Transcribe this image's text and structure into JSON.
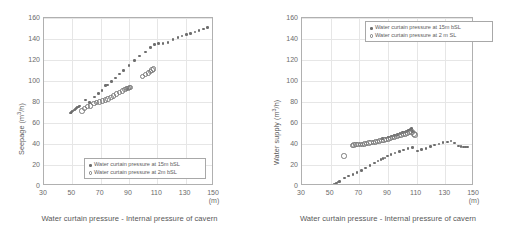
{
  "chart_data": [
    {
      "id": "left",
      "type": "scatter",
      "title": "",
      "xlabel": "Water curtain pressure - Internal pressure of cavern",
      "xunit": "(m)",
      "ylabel": "Seepage (m³/h)",
      "ylabel_main": "Seepage (m",
      "ylabel_exp": "3",
      "ylabel_tail": "/h)",
      "xlim": [
        30,
        150
      ],
      "ylim": [
        0,
        160
      ],
      "xticks": [
        30,
        50,
        70,
        90,
        110,
        130,
        150
      ],
      "yticks": [
        0,
        20,
        40,
        60,
        80,
        100,
        120,
        140,
        160
      ],
      "grid": true,
      "legend_position": "inside-bottom-right",
      "series": [
        {
          "name": "Water curtain pressure at 15m bSL",
          "marker": "filled-circle",
          "color": "#6d6d6d",
          "points": [
            [
              48.5,
              69.5
            ],
            [
              49.2,
              70.2
            ],
            [
              49.9,
              70.8
            ],
            [
              50.6,
              71.6
            ],
            [
              51.3,
              72.3
            ],
            [
              52.0,
              73.0
            ],
            [
              52.7,
              73.8
            ],
            [
              53.4,
              74.5
            ],
            [
              54.2,
              75.4
            ],
            [
              55.0,
              76.3
            ],
            [
              59.5,
              81.8
            ],
            [
              62.0,
              79.5
            ],
            [
              65.5,
              84.6
            ],
            [
              68.5,
              88.2
            ],
            [
              71.0,
              91.0
            ],
            [
              73.5,
              95.8
            ],
            [
              75.0,
              96.0
            ],
            [
              77.5,
              99.5
            ],
            [
              80.5,
              103.0
            ],
            [
              83.5,
              106.5
            ],
            [
              86.0,
              110.0
            ],
            [
              88.8,
              92.5
            ],
            [
              90.0,
              114.8
            ],
            [
              94.0,
              119.5
            ],
            [
              97.5,
              123.7
            ],
            [
              101.5,
              127.8
            ],
            [
              105.0,
              131.8
            ],
            [
              108.0,
              134.5
            ],
            [
              111.0,
              135.5
            ],
            [
              114.0,
              135.8
            ],
            [
              117.5,
              136.8
            ],
            [
              121.0,
              139.5
            ],
            [
              124.5,
              141.6
            ],
            [
              127.5,
              143.0
            ],
            [
              130.5,
              144.2
            ],
            [
              133.5,
              145.4
            ],
            [
              136.5,
              146.6
            ],
            [
              139.5,
              148.0
            ],
            [
              142.5,
              149.5
            ],
            [
              145.5,
              150.8
            ]
          ]
        },
        {
          "name": "Water curtain pressure at 2m bSL",
          "marker": "open-circle",
          "color": "#7a7a7a",
          "points": [
            [
              56.0,
              72.5
            ],
            [
              58.0,
              74.8
            ],
            [
              60.0,
              76.5
            ],
            [
              62.0,
              77.0
            ],
            [
              64.5,
              79.5
            ],
            [
              66.5,
              80.3
            ],
            [
              68.5,
              81.0
            ],
            [
              70.5,
              81.8
            ],
            [
              72.5,
              82.8
            ],
            [
              74.5,
              83.8
            ],
            [
              76.5,
              85.2
            ],
            [
              78.5,
              86.8
            ],
            [
              80.5,
              88.5
            ],
            [
              82.5,
              90.0
            ],
            [
              84.5,
              91.6
            ],
            [
              86.5,
              93.0
            ],
            [
              87.5,
              93.6
            ],
            [
              88.5,
              94.0
            ],
            [
              89.5,
              94.6
            ],
            [
              90.5,
              95.0
            ],
            [
              99.0,
              105.5
            ],
            [
              101.0,
              107.0
            ],
            [
              103.0,
              108.5
            ],
            [
              104.5,
              110.2
            ],
            [
              105.5,
              111.5
            ],
            [
              106.5,
              112.5
            ]
          ]
        }
      ],
      "legend": [
        {
          "label": "Water curtain pressure at 15m bSL",
          "marker": "filled-circle"
        },
        {
          "label": "Water curtain pressure at 2m bSL",
          "marker": "open-circle"
        }
      ]
    },
    {
      "id": "right",
      "type": "scatter",
      "title": "",
      "xlabel": "Water curtain pressure - Internal pressure of cavern",
      "xunit": "(m)",
      "ylabel": "Water supply (m³/h)",
      "ylabel_main": "Water supply (m",
      "ylabel_exp": "3",
      "ylabel_tail": "/h)",
      "xlim": [
        30,
        150
      ],
      "ylim": [
        0,
        160
      ],
      "xticks": [
        30,
        50,
        70,
        90,
        110,
        130,
        150
      ],
      "yticks": [
        0,
        20,
        40,
        60,
        80,
        100,
        120,
        140,
        160
      ],
      "grid": true,
      "legend_position": "inside-top-right",
      "series": [
        {
          "name": "Water curtain pressure at 15m bSL",
          "marker": "filled-circle",
          "color": "#6d6d6d",
          "points": [
            [
              48.5,
              0.3
            ],
            [
              49.3,
              0.4
            ],
            [
              50.0,
              0.5
            ],
            [
              50.8,
              0.7
            ],
            [
              51.5,
              1.0
            ],
            [
              52.2,
              1.3
            ],
            [
              53.0,
              1.8
            ],
            [
              53.8,
              2.3
            ],
            [
              54.5,
              3.0
            ],
            [
              55.2,
              3.7
            ],
            [
              56.0,
              4.4
            ],
            [
              59.5,
              7.5
            ],
            [
              62.5,
              9.5
            ],
            [
              65.5,
              11.0
            ],
            [
              68.5,
              13.0
            ],
            [
              71.5,
              15.0
            ],
            [
              74.5,
              17.0
            ],
            [
              77.5,
              19.5
            ],
            [
              80.5,
              22.0
            ],
            [
              83.0,
              24.0
            ],
            [
              85.0,
              25.5
            ],
            [
              86.5,
              26.0
            ],
            [
              88.0,
              26.5
            ],
            [
              89.5,
              28.5
            ],
            [
              92.0,
              30.0
            ],
            [
              95.0,
              31.5
            ],
            [
              98.0,
              33.0
            ],
            [
              101.0,
              34.3
            ],
            [
              104.0,
              35.5
            ],
            [
              107.0,
              36.5
            ],
            [
              86.0,
              45.0
            ],
            [
              88.5,
              45.8
            ],
            [
              90.5,
              46.5
            ],
            [
              92.5,
              47.5
            ],
            [
              94.5,
              48.3
            ],
            [
              96.5,
              49.2
            ],
            [
              98.5,
              50.0
            ],
            [
              100.0,
              50.8
            ],
            [
              101.5,
              51.5
            ],
            [
              102.5,
              52.0
            ],
            [
              103.5,
              52.5
            ],
            [
              104.5,
              53.2
            ],
            [
              105.5,
              54.0
            ],
            [
              106.5,
              54.8
            ],
            [
              107.0,
              52.0
            ],
            [
              110.5,
              33.5
            ],
            [
              113.5,
              34.5
            ],
            [
              116.5,
              35.5
            ],
            [
              119.5,
              37.5
            ],
            [
              122.5,
              39.0
            ],
            [
              125.5,
              40.0
            ],
            [
              128.5,
              41.5
            ],
            [
              131.5,
              42.0
            ],
            [
              134.0,
              42.8
            ],
            [
              136.5,
              41.0
            ],
            [
              139.0,
              38.0
            ],
            [
              141.0,
              37.5
            ],
            [
              142.5,
              37.3
            ],
            [
              144.0,
              37.2
            ],
            [
              145.5,
              37.0
            ]
          ]
        },
        {
          "name": "Water curtain pressure at 2 m SL",
          "marker": "open-circle",
          "color": "#7a7a7a",
          "points": [
            [
              58.5,
              29.5
            ],
            [
              64.5,
              39.5
            ],
            [
              65.5,
              40.0
            ],
            [
              67.0,
              40.2
            ],
            [
              68.5,
              40.3
            ],
            [
              70.0,
              40.4
            ],
            [
              71.5,
              40.6
            ],
            [
              73.0,
              41.0
            ],
            [
              74.5,
              41.4
            ],
            [
              76.0,
              41.8
            ],
            [
              77.5,
              42.2
            ],
            [
              79.0,
              42.6
            ],
            [
              80.5,
              43.0
            ],
            [
              82.0,
              43.4
            ],
            [
              83.5,
              43.8
            ],
            [
              85.0,
              44.3
            ],
            [
              86.5,
              44.8
            ],
            [
              88.0,
              45.2
            ],
            [
              89.5,
              45.8
            ],
            [
              91.0,
              46.4
            ],
            [
              92.5,
              47.0
            ],
            [
              94.0,
              47.6
            ],
            [
              95.5,
              48.2
            ],
            [
              97.0,
              48.8
            ],
            [
              98.5,
              49.4
            ],
            [
              100.0,
              50.0
            ],
            [
              101.5,
              50.6
            ],
            [
              103.0,
              51.2
            ],
            [
              104.5,
              51.8
            ],
            [
              106.0,
              52.4
            ],
            [
              107.5,
              50.5
            ],
            [
              108.0,
              49.5
            ]
          ]
        }
      ],
      "legend": [
        {
          "label": "Water curtain pressure at 15m bSL",
          "marker": "filled-circle"
        },
        {
          "label": "Water curtain pressure at 2 m SL",
          "marker": "open-circle"
        }
      ]
    }
  ]
}
